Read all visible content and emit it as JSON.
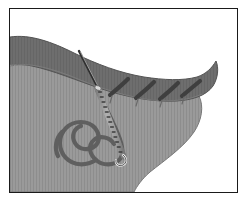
{
  "figure": {
    "domain": "medical-illustration",
    "frame": {
      "border_color": "#1a1a1a",
      "border_width": 1,
      "background": "#ffffff",
      "inset_left": 9,
      "inset_top": 8,
      "inset_width": 229,
      "inset_height": 185
    },
    "colors": {
      "background": "#ffffff",
      "dark_tissue": "#6e6e6e",
      "dark_tissue_edge": "#5a5a5a",
      "light_tissue": "#9a9a9a",
      "light_tissue_edge": "#7d7d7d",
      "suture_thread": "#5f5f5f",
      "needle_body": "#d8d8d8",
      "needle_shadow": "#3c3c3c",
      "stitch": "#3f3f3f",
      "outline": "#4a4a4a"
    },
    "elements": {
      "dark_band_label": "dark-tissue-band",
      "light_tissue_label": "light-tissue-mass",
      "needle_label": "suture-needle",
      "thread_label": "suture-thread",
      "stitch_label": "completed-stitch",
      "wound_edge_label": "wound-margin"
    },
    "stitches": [
      {
        "x1": 112,
        "y1": 93,
        "x2": 127,
        "y2": 80
      },
      {
        "x1": 138,
        "y1": 96,
        "x2": 153,
        "y2": 83
      },
      {
        "x1": 162,
        "y1": 97,
        "x2": 177,
        "y2": 84
      },
      {
        "x1": 183,
        "y1": 94,
        "x2": 198,
        "y2": 82
      }
    ],
    "needle": {
      "tail_x": 80,
      "tail_y": 52,
      "entry_x": 97,
      "entry_y": 88,
      "tip_x": 124,
      "tip_y": 158,
      "segments": 16
    },
    "labels": {
      "caption": ""
    }
  }
}
